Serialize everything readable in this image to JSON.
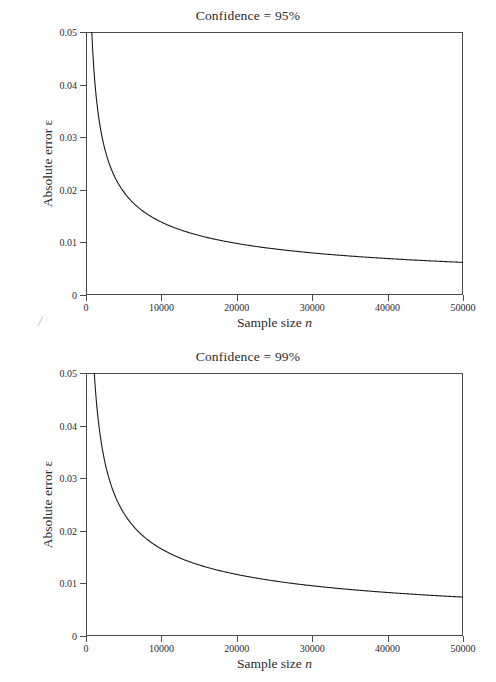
{
  "document": {
    "kind": "scanned-figure",
    "background_color": "#ffffff",
    "line_color": "#1a1a1a",
    "axis_color": "#4a4a4a"
  },
  "figures": [
    {
      "id": "confidence-95",
      "title": "Confidence = 95%",
      "xlabel_plain": "Sample size ",
      "xlabel_italic": "n",
      "ylabel": "Absolute error ε"
    },
    {
      "id": "confidence-99",
      "title": "Confidence = 99%",
      "xlabel_plain": "Sample size ",
      "xlabel_italic": "n",
      "ylabel": "Absolute error ε"
    }
  ],
  "axis": {
    "x_ticklabels": [
      "0",
      "10000",
      "20000",
      "30000",
      "40000",
      "50000"
    ],
    "x_tickvalues": [
      0,
      10000,
      20000,
      30000,
      40000,
      50000
    ],
    "y_ticklabels": [
      "0",
      "0.01",
      "0.02",
      "0.03",
      "0.04",
      "0.05"
    ],
    "y_tickvalues": [
      0,
      0.01,
      0.02,
      0.03,
      0.04,
      0.05
    ]
  },
  "chart_data": [
    {
      "type": "line",
      "title": "Confidence = 95%",
      "xlabel": "Sample size n",
      "ylabel": "Absolute error ε",
      "xlim": [
        0,
        50000
      ],
      "ylim": [
        0,
        0.05
      ],
      "grid": false,
      "legend": "none",
      "xticks": [
        0,
        10000,
        20000,
        30000,
        40000,
        50000
      ],
      "yticks": [
        0,
        0.01,
        0.02,
        0.03,
        0.04,
        0.05
      ],
      "series": [
        {
          "name": "absolute error at 95% confidence",
          "x": [
            500,
            700,
            1000,
            1500,
            2000,
            2500,
            3000,
            4000,
            5000,
            6000,
            7000,
            8000,
            10000,
            12000,
            14000,
            16000,
            18000,
            20000,
            24000,
            28000,
            32000,
            36000,
            40000,
            44000,
            48000,
            50000
          ],
          "y": [
            0.05,
            0.05,
            0.044,
            0.036,
            0.0312,
            0.0279,
            0.0255,
            0.0221,
            0.0197,
            0.018,
            0.0167,
            0.0156,
            0.0139,
            0.0127,
            0.0118,
            0.011,
            0.0104,
            0.0099,
            0.009,
            0.0083,
            0.0078,
            0.0074,
            0.007,
            0.0067,
            0.0064,
            0.0062
          ]
        }
      ]
    },
    {
      "type": "line",
      "title": "Confidence = 99%",
      "xlabel": "Sample size n",
      "ylabel": "Absolute error ε",
      "xlim": [
        0,
        50000
      ],
      "ylim": [
        0,
        0.05
      ],
      "grid": false,
      "legend": "none",
      "xticks": [
        0,
        10000,
        20000,
        30000,
        40000,
        50000
      ],
      "yticks": [
        0,
        0.01,
        0.02,
        0.03,
        0.04,
        0.05
      ],
      "series": [
        {
          "name": "absolute error at 99% confidence",
          "x": [
            900,
            1200,
            1500,
            2000,
            2500,
            3000,
            4000,
            5000,
            6000,
            7000,
            8000,
            10000,
            12000,
            14000,
            16000,
            18000,
            20000,
            24000,
            28000,
            32000,
            36000,
            40000,
            44000,
            48000,
            50000
          ],
          "y": [
            0.05,
            0.048,
            0.043,
            0.0372,
            0.0333,
            0.0304,
            0.0263,
            0.0235,
            0.0215,
            0.0199,
            0.0186,
            0.0166,
            0.0152,
            0.0141,
            0.0132,
            0.0124,
            0.0118,
            0.0108,
            0.0099,
            0.0093,
            0.0088,
            0.0083,
            0.0079,
            0.0076,
            0.0074
          ]
        }
      ]
    }
  ]
}
